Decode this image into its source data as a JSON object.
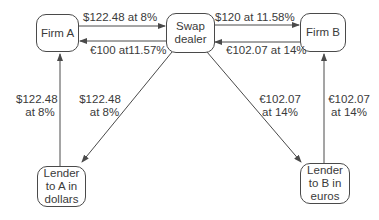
{
  "nodes": {
    "firm_a": "Firm A",
    "swap_dealer": "Swap dealer",
    "firm_b": "Firm B",
    "lender_a": "Lender to A in dollars",
    "lender_b": "Lender to B in euros"
  },
  "edges": {
    "a_to_dealer": "$122.48 at 8%",
    "dealer_to_a": "€100 at11.57%",
    "dealer_to_b": "$120 at 11.58%",
    "b_to_dealer": "€102.07 at 14%",
    "lender_a_to_a_line1": "$122.48",
    "lender_a_to_a_line2": "at 8%",
    "dealer_to_lender_a_line1": "$122.48",
    "dealer_to_lender_a_line2": "at 8%",
    "dealer_to_lender_b_line1": "€102.07",
    "dealer_to_lender_b_line2": "at 14%",
    "lender_b_to_b_line1": "€102.07",
    "lender_b_to_b_line2": "at 14%"
  },
  "colors": {
    "line": "#4a4a4a",
    "text": "#3a3a3a"
  }
}
